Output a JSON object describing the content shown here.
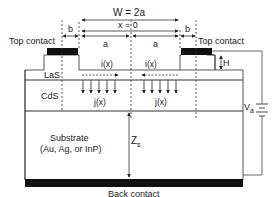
{
  "diagram": {
    "labels": {
      "width": "W = 2a",
      "center": "x = 0",
      "a_left": "a",
      "a_right": "a",
      "b_left": "b",
      "b_right": "b",
      "top_contact_left": "Top contact",
      "top_contact_right": "Top contact",
      "height": "H",
      "current_i_left": "i(x)",
      "current_i_right": "i(x)",
      "current_j_left": "j(x)",
      "current_j_right": "j(x)",
      "layer_las": "LaS",
      "layer_cds": "CdS",
      "substrate_line1": "Substrate",
      "substrate_line2": "(Au, Ag, or InP)",
      "substrate_depth": "Z",
      "substrate_depth_sub": "s",
      "voltage": "V",
      "voltage_sub": "a",
      "back_contact": "Back contact"
    },
    "colors": {
      "line": "#333333",
      "contact": "#111111",
      "text": "#1a1a1a"
    }
  }
}
